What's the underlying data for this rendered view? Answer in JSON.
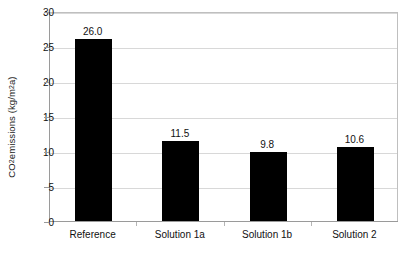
{
  "chart_data": {
    "type": "bar",
    "title": "",
    "xlabel": "",
    "ylabel": "CO2 emissions (kg/m²a)",
    "ylabel_parts": {
      "prefix": "CO",
      "subscript": "2",
      "mid": " emissions (kg/m",
      "superscript": "2",
      "suffix": "a)"
    },
    "categories": [
      "Reference",
      "Solution 1a",
      "Solution 1b",
      "Solution 2"
    ],
    "values": [
      26.0,
      11.5,
      9.8,
      10.6
    ],
    "value_labels": [
      "26.0",
      "11.5",
      "9.8",
      "10.6"
    ],
    "ylim": [
      0,
      30
    ],
    "ytick_values": [
      0,
      5,
      10,
      15,
      20,
      25,
      30
    ],
    "ytick_labels": [
      "0",
      "5",
      "10",
      "15",
      "20",
      "25",
      "30"
    ],
    "grid": "horizontal",
    "legend": "none",
    "bar_color": "#000000",
    "grid_color": "#d8d8d8",
    "axis_color": "#9a9a9a",
    "background_color": "#ffffff",
    "text_color": "#111111"
  }
}
